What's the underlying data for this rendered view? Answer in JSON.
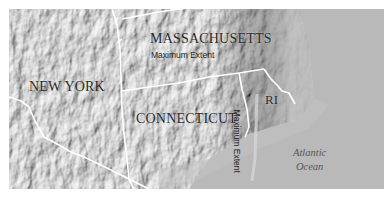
{
  "map": {
    "title": "Maximum extent map of southern New England",
    "labels": {
      "new_york": "NEW YORK",
      "massachusetts": "MASSACHUSETTS",
      "connecticut": "CONNECTICUT",
      "rhode_island": "RI",
      "ma_extent": "Maximum Extent",
      "ct_extent": "Maximum Extent",
      "ocean_line1": "Atlantic",
      "ocean_line2": "Ocean"
    },
    "colors": {
      "terrain_light": "#d6d6d6",
      "terrain_mid": "#b4b4b4",
      "terrain_dark": "#7a7a7a",
      "ocean": "#b9b9b9",
      "boundary": "#ffffff",
      "label_text": "#2a2a2a"
    }
  }
}
